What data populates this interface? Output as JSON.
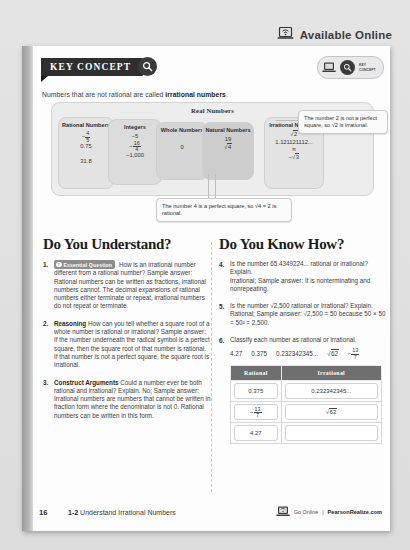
{
  "header": {
    "available_online": "Available Online",
    "laptop_icon": "laptop-wifi-icon"
  },
  "key_concept": {
    "banner_label": "KEY CONCEPT",
    "search_icon": "magnifier-icon",
    "badge_laptop_icon": "laptop-icon",
    "badge_key_icon": "magnifier-icon",
    "badge_text": "KEY CONCEPT",
    "lead_pre": "Numbers that are not rational are called ",
    "lead_bold": "irrational numbers",
    "lead_post": "."
  },
  "diagram": {
    "title": "Real Numbers",
    "rational": {
      "title": "Rational Numbers",
      "v_frac_n": "4",
      "v_frac_d": "5",
      "v_frac_sign": "−",
      "v2": "0.75",
      "v3": "31.8"
    },
    "integers": {
      "title": "Integers",
      "v1": "−5",
      "v_frac_n": "16",
      "v_frac_d": "4",
      "v_frac_sign": "−",
      "v3": "−1,000"
    },
    "whole": {
      "title": "Whole Numbers",
      "v1": "0"
    },
    "natural": {
      "title": "Natural Numbers",
      "v1": "19",
      "v2_radicand": "4"
    },
    "irrational": {
      "title": "Irrational Numbers",
      "v1_radicand": "2",
      "v2": "1.121121112...",
      "v3": "π",
      "v4_sign": "−",
      "v4_radicand": "3"
    },
    "callout_two": "The number 2 is not a perfect square, so √2 is irrational.",
    "callout_four": "The number 4 is a perfect square, so √4 = 2 is rational."
  },
  "understand": {
    "heading": "Do You Understand?",
    "questions": [
      {
        "num": "1.",
        "badge": "Essential Question",
        "badge_icon": "question-mark-icon",
        "text": "How is an irrational number different from a rational number? Sample answer: Rational numbers can be written as fractions, irrational numbers cannot. The decimal expansions of rational numbers either terminate or repeat, irrational numbers do not repeat or terminate."
      },
      {
        "num": "2.",
        "label": "Reasoning",
        "text": "How can you tell whether a square root of a whole number is rational or irrational? Sample answer: If the number underneath the radical symbol is a perfect square, then the square root of that number is rational. If that number is not a perfect square, the square root is irrational."
      },
      {
        "num": "3.",
        "label": "Construct Arguments",
        "text": "Could a number ever be both rational and irrational? Explain. No; Sample answer: Irrational numbers are numbers that cannot be written in fraction form where the denominator is not 0. Rational numbers can be written in this form."
      }
    ]
  },
  "know_how": {
    "heading": "Do You Know How?",
    "q4": {
      "num": "4.",
      "text_a": "Is the number 65.4349224... rational or irrational? Explain.",
      "text_b": "Irrational; Sample answer: It is nonterminating and nonrepeating."
    },
    "q5": {
      "num": "5.",
      "text_a": "Is the number √2,500 rational or irrational? Explain.",
      "radicand": "2,500",
      "text_b": "Rational; Sample answer: √2,500 = 50 because 50 × 50 = 50² = 2,500."
    },
    "q6": {
      "num": "6.",
      "prompt": "Classify each number as rational or irrational.",
      "numbers": [
        "4.27",
        "0.375",
        "0.232342345...",
        "√62",
        "−13/7"
      ],
      "num_radical_radicand": "62",
      "num_frac_sign": "−",
      "num_frac_n": "13",
      "num_frac_d": "7",
      "table": {
        "headers": [
          "Rational",
          "Irrational"
        ],
        "rows": [
          {
            "rational": "0.375",
            "irrational": "0.232342345..."
          },
          {
            "rational_frac_sign": "−",
            "rational_frac_n": "13",
            "rational_frac_d": "7",
            "irrational_radicand": "62"
          },
          {
            "rational": "4.27",
            "irrational": ""
          }
        ]
      }
    }
  },
  "footer": {
    "page": "16",
    "lesson": "1-2",
    "lesson_title": "Understand Irrational Numbers",
    "go_online": "Go Online",
    "separator": "|",
    "site": "PearsonRealize.com",
    "laptop_icon": "laptop-wifi-icon"
  }
}
